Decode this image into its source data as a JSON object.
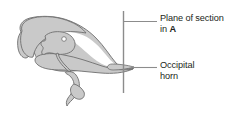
{
  "figure": {
    "type": "anatomical-line-drawing",
    "background_color": "#ffffff",
    "shape_fill_color": "#c9c9c9",
    "shape_stroke_color": "#6e6e6e",
    "line_color": "#8c8c8c",
    "text_color": "#231f20"
  },
  "labels": {
    "plane_of_section": {
      "line1": "Plane of section",
      "line2_prefix": "in ",
      "line2_reference": "A"
    },
    "occipital_horn": {
      "line1": "Occipital",
      "line2": "horn"
    }
  },
  "annotations": {
    "section_plane_line": "vertical-section-plane",
    "leader_plane": "leader-line-plane-of-section",
    "leader_horn": "leader-line-occipital-horn",
    "foramen": "foramen-marker"
  }
}
